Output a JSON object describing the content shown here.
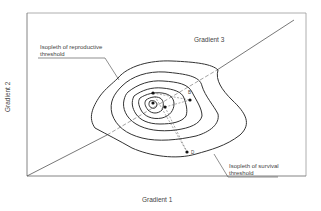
{
  "diagram": {
    "axes": {
      "x_label": "Gradient 1",
      "y_label": "Gradient 2",
      "diagonal_label": "Gradient 3"
    },
    "annotations": {
      "reproductive": "Isopleth of reproductive threshold",
      "reproductive_line1": "Isopleth of reproductive",
      "reproductive_line2": "threshold",
      "survival": "Isopleth of survival threshold",
      "survival_line1": "Isopleth of survival",
      "survival_line2": "threshold"
    },
    "points": [
      {
        "label": "A"
      },
      {
        "label": "B"
      },
      {
        "label": "D"
      }
    ],
    "colors": {
      "line": "#333333",
      "frame": "#888888",
      "background": "#ffffff"
    }
  }
}
